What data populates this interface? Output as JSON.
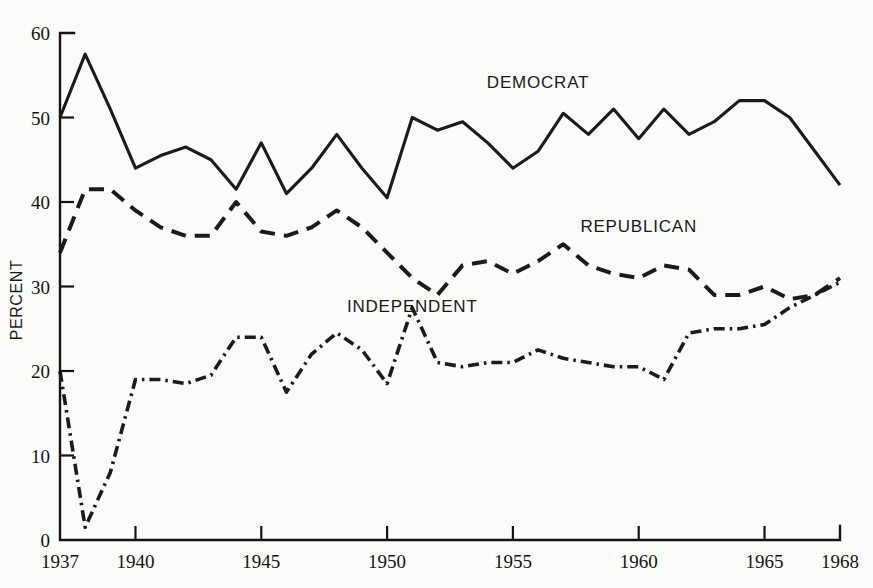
{
  "chart_data": {
    "type": "line",
    "title": "",
    "xlabel": "",
    "ylabel": "PERCENT",
    "xlim": [
      1937,
      1968
    ],
    "ylim": [
      0,
      60
    ],
    "grid": false,
    "legend_position": "inline-annotations",
    "x_tick_labels": [
      "1937",
      "1940",
      "1945",
      "1950",
      "1955",
      "1960",
      "1965",
      "1968"
    ],
    "x_tick_values": [
      1937,
      1940,
      1945,
      1950,
      1955,
      1960,
      1965,
      1968
    ],
    "y_tick_labels": [
      "0",
      "10",
      "20",
      "30",
      "40",
      "50",
      "60"
    ],
    "y_tick_values": [
      0,
      10,
      20,
      30,
      40,
      50,
      60
    ],
    "x": [
      1937,
      1938,
      1939,
      1940,
      1941,
      1942,
      1943,
      1944,
      1945,
      1946,
      1947,
      1948,
      1949,
      1950,
      1951,
      1952,
      1953,
      1954,
      1955,
      1956,
      1957,
      1958,
      1959,
      1960,
      1961,
      1962,
      1963,
      1964,
      1965,
      1966,
      1967,
      1968
    ],
    "series": [
      {
        "name": "DEMOCRAT",
        "style": "solid",
        "label_x": 1956,
        "label_y": 53.5,
        "values": [
          50,
          57.5,
          51,
          44,
          45.5,
          46.5,
          45,
          41.5,
          47,
          41,
          44,
          48,
          44,
          40.5,
          50,
          48.5,
          49.5,
          47,
          44,
          46,
          50.5,
          48,
          51,
          47.5,
          51,
          48,
          49.5,
          52,
          52,
          50,
          46,
          42
        ]
      },
      {
        "name": "REPUBLICAN",
        "style": "dashed",
        "label_x": 1960,
        "label_y": 36.5,
        "values": [
          34,
          41.5,
          41.5,
          39,
          37,
          36,
          36,
          40,
          36.5,
          36,
          37,
          39,
          37,
          34,
          31,
          29,
          32.5,
          33,
          31.5,
          33,
          35,
          32.5,
          31.5,
          31,
          32.5,
          32,
          29,
          29,
          30,
          28.5,
          29,
          31
        ]
      },
      {
        "name": "INDEPENDENT",
        "style": "dash-dot",
        "label_x": 1951,
        "label_y": 27,
        "values": [
          20,
          1.5,
          8,
          19,
          19,
          18.5,
          19.5,
          24,
          24,
          17.5,
          22,
          24.5,
          22.5,
          18.5,
          27.5,
          21,
          20.5,
          21,
          21,
          22.5,
          21.5,
          21,
          20.5,
          20.5,
          19,
          24.5,
          25,
          25,
          25.5,
          27.5,
          29,
          30.5
        ]
      }
    ]
  },
  "axes": {
    "y_axis_title": "PERCENT"
  }
}
